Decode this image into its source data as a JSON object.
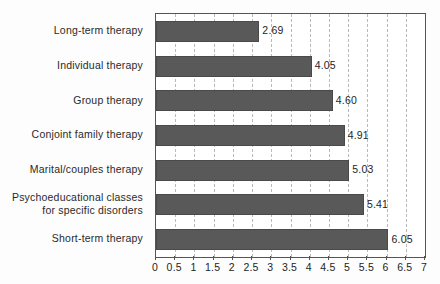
{
  "chart_data": {
    "type": "bar",
    "orientation": "horizontal",
    "title": "",
    "xlabel": "",
    "ylabel": "",
    "xlim": [
      0,
      7
    ],
    "grid": true,
    "legend": "none",
    "tick_step": 0.5,
    "tick_labels": [
      "0",
      "0.5",
      "1",
      "1.5",
      "2",
      "2.5",
      "3",
      "3.5",
      "4",
      "4.5",
      "5",
      "5.5",
      "6",
      "6.5",
      "7"
    ],
    "tick_values": [
      0,
      0.5,
      1,
      1.5,
      2,
      2.5,
      3,
      3.5,
      4,
      4.5,
      5,
      5.5,
      6,
      6.5,
      7
    ],
    "categories": [
      "Long-term therapy",
      "Individual therapy",
      "Group therapy",
      "Conjoint family therapy",
      "Marital/couples therapy",
      "Psychoeducational classes\nfor specific disorders",
      "Short-term therapy"
    ],
    "values": [
      2.69,
      4.05,
      4.6,
      4.91,
      5.03,
      5.41,
      6.05
    ],
    "value_labels": [
      "2.69",
      "4.05",
      "4.60",
      "4.91",
      "5.03",
      "5.41",
      "6.05"
    ],
    "colors": {
      "bar_fill": "#595959",
      "bar_border": "#4a4a4a",
      "frame": "#555555",
      "gridline": "#b9b9b9",
      "text": "#1e1e1e",
      "background": "#fdfdfd",
      "plot_background": "#ffffff"
    }
  }
}
